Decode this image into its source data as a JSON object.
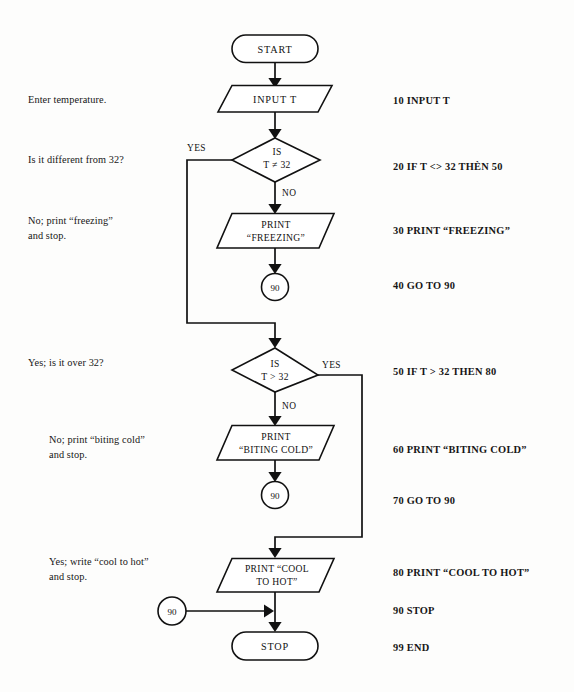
{
  "diagram": {
    "background_color": "#fdfdfc",
    "line_color": "#111111"
  },
  "nodes": {
    "start": {
      "label": "START",
      "shape": "terminator"
    },
    "input_t": {
      "label": "INPUT T",
      "shape": "io-parallelogram"
    },
    "decision_ne32": {
      "line1": "IS",
      "line2": "T ≠ 32",
      "shape": "decision"
    },
    "print_freezing": {
      "line1": "PRINT",
      "line2": "“FREEZING”",
      "shape": "io-parallelogram"
    },
    "connector_90_a": {
      "label": "90",
      "shape": "connector-circle"
    },
    "decision_gt32": {
      "line1": "IS",
      "line2": "T > 32",
      "shape": "decision"
    },
    "print_biting_cold": {
      "line1": "PRINT",
      "line2": "“BITING COLD”",
      "shape": "io-parallelogram"
    },
    "connector_90_b": {
      "label": "90",
      "shape": "connector-circle"
    },
    "print_cool_to_hot": {
      "line1": "PRINT  “COOL",
      "line2": "TO HOT”",
      "shape": "io-parallelogram"
    },
    "connector_90_c": {
      "label": "90",
      "shape": "connector-circle"
    },
    "stop": {
      "label": "STOP",
      "shape": "terminator"
    }
  },
  "branch_labels": {
    "yes_1": "YES",
    "no_1": "NO",
    "yes_2": "YES",
    "no_2": "NO"
  },
  "notes": [
    {
      "text": "Enter temperature."
    },
    {
      "text": "Is it different from 32?"
    },
    {
      "text": "No; print “freezing”\nand stop."
    },
    {
      "text": "Yes; is it over 32?"
    },
    {
      "text": "No; print “biting cold”\nand stop."
    },
    {
      "text": "Yes; write “cool to hot”\nand stop."
    }
  ],
  "code_lines": [
    {
      "text": "10 INPUT T"
    },
    {
      "text": "20 IF T <> 32 THÈN 50"
    },
    {
      "text": "30 PRINT “FREEZING”"
    },
    {
      "text": "40 GO TO 90"
    },
    {
      "text": "50 IF T > 32 THEN 80"
    },
    {
      "text": "60 PRINT “BITING COLD”"
    },
    {
      "text": "70 GO TO 90"
    },
    {
      "text": "80 PRINT “COOL TO HOT”"
    },
    {
      "text": "90 STOP"
    },
    {
      "text": "99 END"
    }
  ]
}
